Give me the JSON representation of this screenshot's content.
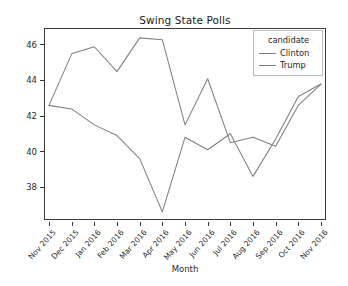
{
  "figure": {
    "title": "Swing State Polls",
    "background": "#ffffff",
    "axes_color": "#3a3a3a"
  },
  "legend": {
    "title": "candidate",
    "position": "upper-right",
    "entries": [
      {
        "label": "Clinton",
        "color": "#7f7f7f"
      },
      {
        "label": "Trump",
        "color": "#7f7f7f"
      }
    ]
  },
  "chart_data": {
    "type": "line",
    "title": "Swing State Polls",
    "xlabel": "Month",
    "ylabel": "Average Percent",
    "grid": false,
    "legend_position": "upper-right",
    "legend_title": "candidate",
    "ylim": [
      36.2,
      46.9
    ],
    "yticks": [
      38,
      40,
      42,
      44,
      46
    ],
    "categories": [
      "Nov 2015",
      "Dec 2015",
      "Jan 2016",
      "Feb 2016",
      "Mar 2016",
      "Apr 2016",
      "May 2016",
      "Jun 2016",
      "Jul 2016",
      "Aug 2016",
      "Sep 2016",
      "Oct 2016",
      "Nov 2016"
    ],
    "series": [
      {
        "name": "Clinton",
        "color": "#7f7f7f",
        "values": [
          42.6,
          45.5,
          45.9,
          44.5,
          46.4,
          46.3,
          41.5,
          44.1,
          40.5,
          40.8,
          40.3,
          42.6,
          43.8
        ]
      },
      {
        "name": "Trump",
        "color": "#7f7f7f",
        "values": [
          42.6,
          42.4,
          41.5,
          40.9,
          39.6,
          36.6,
          40.8,
          40.1,
          41.0,
          38.6,
          40.7,
          43.1,
          43.8
        ]
      }
    ]
  }
}
